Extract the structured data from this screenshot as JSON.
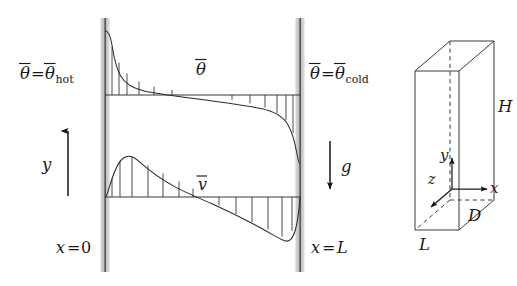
{
  "figure": {
    "width": 517,
    "height": 286,
    "background": "#ffffff",
    "ink": "#2b2b2b",
    "wall_fill": "#b8b8b8"
  },
  "left_panel": {
    "title_hidden": "Differentially heated vertical cavity, cross-section",
    "walls": {
      "left": {
        "name": "hot-wall",
        "x": 105,
        "top": 18,
        "bottom": 272,
        "label": "x = 0",
        "boundary_label": "θ̄ = θ̄hot"
      },
      "right": {
        "name": "cold-wall",
        "x": 300,
        "top": 18,
        "bottom": 272,
        "label": "x = L",
        "boundary_label": "θ̄ = θ̄cold"
      }
    },
    "labels": {
      "theta_hot_sym": "θ",
      "theta_hot_eq": "=",
      "theta_hot_sub": "hot",
      "theta_cold_sym": "θ",
      "theta_cold_eq": "=",
      "theta_cold_sub": "cold",
      "theta_profile": "θ",
      "velocity_profile": "v",
      "y_axis": "y",
      "gravity": "g",
      "x_zero_var": "x",
      "x_zero_eq": "=",
      "x_zero_val": "0",
      "x_L_var": "x",
      "x_L_eq": "=",
      "x_L_val": "L"
    },
    "temperature_profile": {
      "name": "mean-temperature-profile",
      "symbol": "θ̄",
      "baseline_y": 95,
      "description": "S-shaped: steep thermal boundary layer at hot wall, weak linear stratification in core, steep drop at cold wall",
      "hatch_count_left": 5,
      "hatch_count_right": 5
    },
    "velocity_profile": {
      "name": "mean-vertical-velocity-profile",
      "symbol": "v̄",
      "baseline_y": 197,
      "description": "Antisymmetric: upward jet near hot wall, near-zero core, downward jet near cold wall",
      "hatch_count_left": 6,
      "hatch_count_right": 5
    },
    "arrows": {
      "y_arrow": {
        "name": "y-axis-arrow",
        "direction": "up",
        "x": 68,
        "y_top": 128,
        "y_bottom": 196
      },
      "g_arrow": {
        "name": "gravity-arrow",
        "direction": "down",
        "x": 330,
        "y_top": 140,
        "y_bottom": 192
      }
    }
  },
  "right_panel": {
    "title_hidden": "Three-dimensional cavity geometry",
    "labels": {
      "height": "H",
      "depth": "D",
      "width": "L",
      "axis_x": "x",
      "axis_y": "y",
      "axis_z": "z"
    },
    "box": {
      "name": "cavity-box",
      "description": "Thin tall slab drawn in oblique projection; hidden rear vertical edge and hidden bottom-rear edges dashed"
    },
    "axes": {
      "origin": {
        "x": 452,
        "y": 189
      },
      "x_direction": "right",
      "y_direction": "up",
      "z_direction": "toward lower-left (out of page)"
    }
  }
}
